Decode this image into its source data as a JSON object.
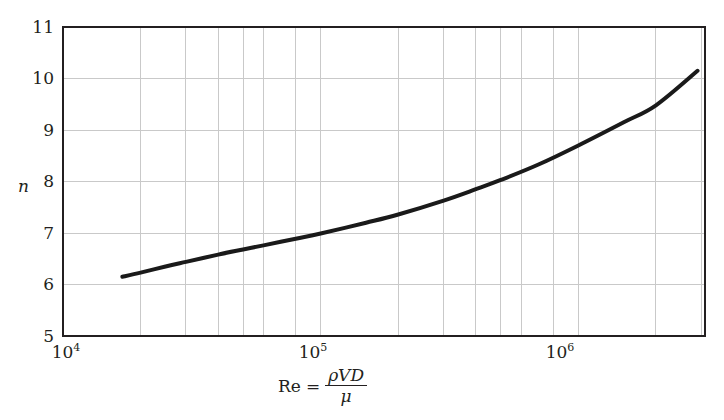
{
  "chart_data": {
    "type": "line",
    "title": "",
    "subtitle": "",
    "xlabel": "Re = ρVD/μ",
    "ylabel": "n",
    "xscale": "log",
    "yscale": "linear",
    "xlim": [
      10000,
      3100000
    ],
    "ylim": [
      5,
      11
    ],
    "grid": true,
    "legend": null,
    "x_tick_labels": [
      "10⁴",
      "10⁵",
      "10⁶"
    ],
    "x_tick_values": [
      10000,
      100000,
      1000000
    ],
    "y_tick_labels": [
      "5",
      "6",
      "7",
      "8",
      "9",
      "10",
      "11"
    ],
    "y_tick_values": [
      5,
      6,
      7,
      8,
      9,
      10,
      11
    ],
    "x_minor_gridlines": [
      20000,
      30000,
      40000,
      50000,
      60000,
      80000,
      200000,
      300000,
      400000,
      500000,
      600000,
      800000,
      2000000,
      3000000
    ],
    "series": [
      {
        "name": "n vs Re",
        "color": "#1a1a1a",
        "line_width": 4,
        "x": [
          17000,
          20000,
          25000,
          30000,
          40000,
          50000,
          60000,
          80000,
          100000,
          150000,
          200000,
          300000,
          400000,
          500000,
          700000,
          1000000,
          1500000,
          2000000,
          2900000
        ],
        "y": [
          6.15,
          6.23,
          6.35,
          6.44,
          6.58,
          6.68,
          6.76,
          6.89,
          6.99,
          7.2,
          7.36,
          7.63,
          7.85,
          8.03,
          8.33,
          8.7,
          9.15,
          9.48,
          10.15
        ]
      }
    ]
  },
  "axes": {
    "y_title": "n",
    "x_title": {
      "lead": "Re",
      "equals": "=",
      "numerator": "ρVD",
      "denominator": "μ"
    },
    "y_ticks": [
      {
        "label": "11",
        "value": 11
      },
      {
        "label": "10",
        "value": 10
      },
      {
        "label": "9",
        "value": 9
      },
      {
        "label": "8",
        "value": 8
      },
      {
        "label": "7",
        "value": 7
      },
      {
        "label": "6",
        "value": 6
      },
      {
        "label": "5",
        "value": 5
      }
    ],
    "x_ticks": [
      {
        "base": "10",
        "exp": "4",
        "value": 10000
      },
      {
        "base": "10",
        "exp": "5",
        "value": 100000
      },
      {
        "base": "10",
        "exp": "6",
        "value": 1000000
      }
    ]
  },
  "style": {
    "frame_color": "#231f20",
    "grid_color": "#c9c9c9",
    "curve_color": "#1a1a1a",
    "background": "#ffffff",
    "text_color": "#231f20"
  }
}
